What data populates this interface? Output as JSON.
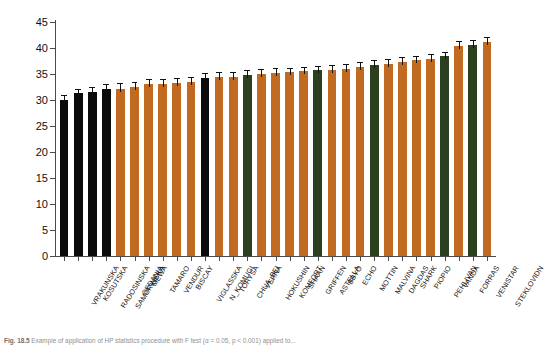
{
  "figure": {
    "caption_prefix": "Fig. 18.5",
    "caption_text": "Example of application of HP statistics procedure with F test (α = 0.05, p < 0.001) applied to..."
  },
  "chart_data": {
    "type": "bar",
    "title": "",
    "xlabel": "",
    "ylabel": "PI",
    "ylabel_sub": "ABS",
    "ylim": [
      0,
      45
    ],
    "yticks": [
      0,
      5,
      10,
      15,
      20,
      25,
      30,
      35,
      40,
      45
    ],
    "ytick_labels": [
      "0",
      "5",
      "10",
      "15",
      "20",
      "25",
      "30",
      "35",
      "40",
      "45"
    ],
    "grid": false,
    "legend": "none",
    "error_bar_type": "standard-error",
    "group_colors": {
      "black": "#0b0b0b",
      "orange": "#c06a22",
      "green": "#2c4020"
    },
    "categories": [
      "VRAKUNSKA",
      "KOSUTSKA",
      "RADOSINSKA",
      "SAMORINSKA",
      "GEDANIA",
      "MEWA",
      "TAMARO",
      "VENDUR",
      "BISCAY",
      "VIGLASSKA",
      "N_KOMUGI",
      "TORYSA",
      "CHUA_BEI",
      "VERNA",
      "HOKUSHIN",
      "KOMFORT",
      "SHAAN",
      "GRIFFEN",
      "ASTELLA",
      "BBYO",
      "ECHO",
      "MOTTIN",
      "MALVINA",
      "DAGDAS",
      "SHARK",
      "PIOPIO",
      "PEHLIVAN",
      "VANDA",
      "FORRAS",
      "VENISTAR",
      "STEKLOVIDN"
    ],
    "values": [
      30.0,
      31.3,
      31.6,
      32.1,
      32.2,
      32.5,
      33.0,
      33.1,
      33.3,
      33.4,
      34.3,
      34.5,
      34.5,
      34.9,
      35.0,
      35.2,
      35.3,
      35.5,
      35.7,
      35.8,
      36.0,
      36.4,
      36.8,
      37.0,
      37.4,
      37.6,
      37.9,
      38.4,
      40.4,
      40.6,
      41.2
    ],
    "errors": [
      1.0,
      0.8,
      0.9,
      0.9,
      1.0,
      1.0,
      1.0,
      0.9,
      0.9,
      1.0,
      0.9,
      0.9,
      0.9,
      0.9,
      0.9,
      0.9,
      0.9,
      0.9,
      0.8,
      0.9,
      0.9,
      0.9,
      0.9,
      0.9,
      0.9,
      0.9,
      0.9,
      0.9,
      0.9,
      0.9,
      0.9
    ],
    "colors": [
      "black",
      "black",
      "black",
      "black",
      "orange",
      "orange",
      "orange",
      "orange",
      "orange",
      "orange",
      "black",
      "orange",
      "orange",
      "green",
      "orange",
      "orange",
      "orange",
      "orange",
      "green",
      "orange",
      "orange",
      "orange",
      "green",
      "orange",
      "orange",
      "orange",
      "orange",
      "green",
      "orange",
      "green",
      "orange"
    ]
  }
}
